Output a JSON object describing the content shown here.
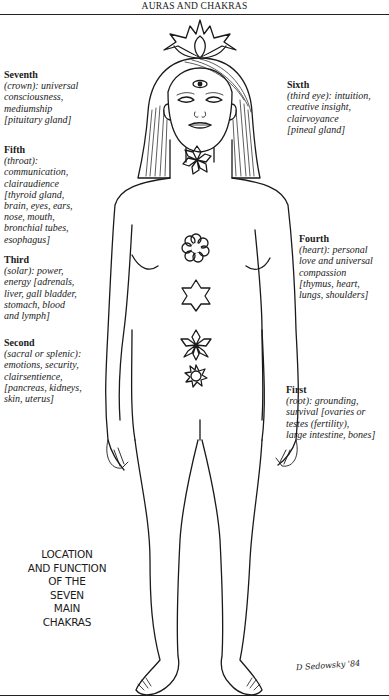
{
  "header": {
    "title": "AURAS AND CHAKRAS"
  },
  "chakras": [
    {
      "title": "Seventh",
      "desc": "(crown): universal\nconsciousness,\nmediumship\n[pituitary gland]"
    },
    {
      "title": "Sixth",
      "desc": "(third eye): intuition,\ncreative insight,\nclairvoyance\n[pineal gland]"
    },
    {
      "title": "Fifth",
      "desc": "(throat):\ncommunication,\nclairaudience\n[thyroid gland,\nbrain, eyes, ears,\nnose, mouth,\nbronchial tubes,\nesophagus]"
    },
    {
      "title": "Fourth",
      "desc": "(heart): personal\nlove and universal\ncompassion\n[thymus, heart,\nlungs, shoulders]"
    },
    {
      "title": "Third",
      "desc": "(solar): power,\nenergy [adrenals,\nliver, gall bladder,\nstomach, blood\nand lymph]"
    },
    {
      "title": "Second",
      "desc": "(sacral or splenic):\nemotions, security,\nclairsentience,\n[pancreas, kidneys,\nskin, uterus]"
    },
    {
      "title": "First",
      "desc": "(root): grounding,\nsurvival [ovaries or\ntestes (fertility),\nlarge intestine, bones]"
    }
  ],
  "caption": "LOCATION\nAND FUNCTION\nOF THE\nSEVEN\nMAIN\nCHAKRAS",
  "signature": "D Sedowsky '84",
  "colors": {
    "ink": "#1a1a1a",
    "paper": "#ffffff"
  }
}
